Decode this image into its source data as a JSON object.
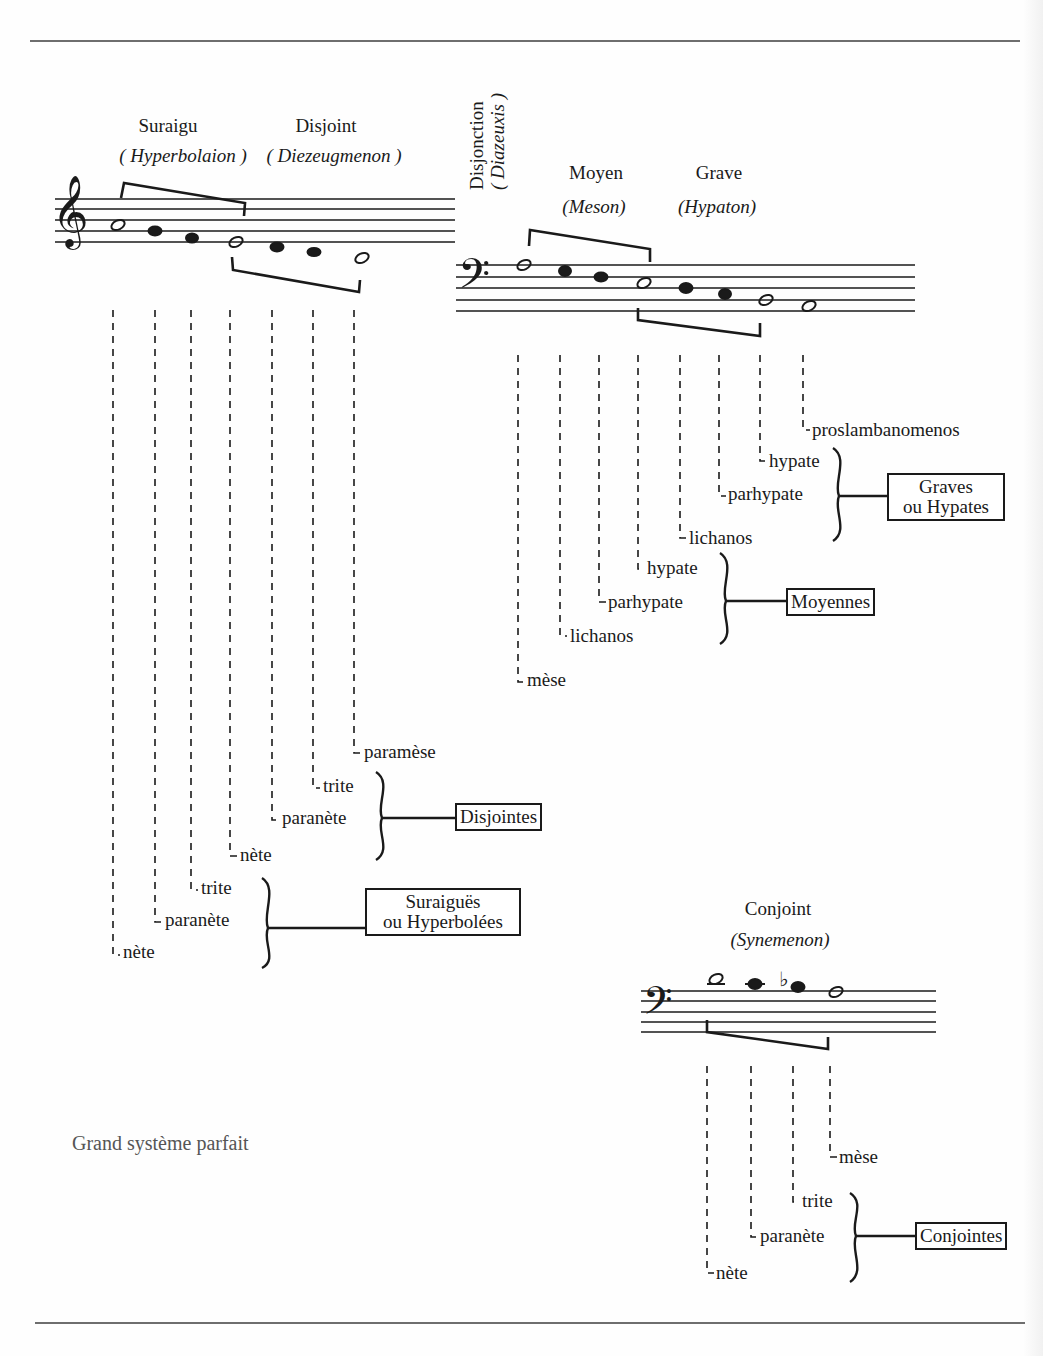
{
  "page": {
    "caption": "Grand système parfait",
    "colors": {
      "ink": "#1a1a1a",
      "rule": "#6e6e6e",
      "caption": "#555555",
      "paper": "#fefefe"
    }
  },
  "tetrachords": {
    "suraigu": {
      "name": "Suraigu",
      "greek": "( Hyperbolaion )"
    },
    "disjoint": {
      "name": "Disjoint",
      "greek": "( Diezeugmenon )"
    },
    "disjonction": {
      "name": "Disjonction",
      "greek": "( Diazeuxis )"
    },
    "moyen": {
      "name": "Moyen",
      "greek": "(Meson)"
    },
    "grave": {
      "name": "Grave",
      "greek": "(Hypaton)"
    },
    "conjoint": {
      "name": "Conjoint",
      "greek": "(Synemenon)"
    }
  },
  "notes": {
    "treble": [
      "nète",
      "paranète",
      "trite",
      "nète",
      "paranète",
      "trite",
      "paramèse"
    ],
    "bass": [
      "mèse",
      "lichanos",
      "parhypate",
      "hypate",
      "lichanos",
      "parhypate",
      "hypate",
      "proslambanomenos"
    ],
    "conjoint": [
      "nète",
      "paranète",
      "trite",
      "mèse"
    ]
  },
  "groups": {
    "suraigues": {
      "line1": "Suraiguës",
      "line2": "ou Hyperbolées"
    },
    "disjointes": {
      "line1": "Disjointes"
    },
    "moyennes": {
      "line1": "Moyennes"
    },
    "graves": {
      "line1": "Graves",
      "line2": "ou Hypates"
    },
    "conjointes": {
      "line1": "Conjointes"
    }
  },
  "icons": {
    "treble_clef": "𝄞",
    "bass_clef": "𝄢",
    "flat": "♭"
  }
}
